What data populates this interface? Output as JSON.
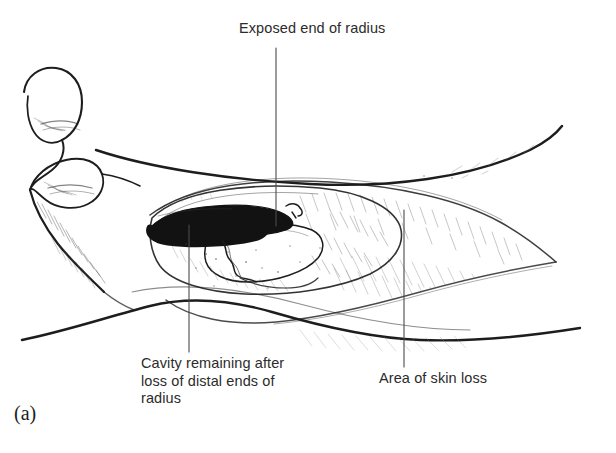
{
  "figure": {
    "marker": "(a)",
    "background_color": "#ffffff",
    "ink_color": "#1d1d1d",
    "text_color": "#2b2b2b"
  },
  "annotations": [
    {
      "id": "exposed-end-of-radius",
      "text": "Exposed end of radius",
      "leader": {
        "x": 276,
        "y_start": 48,
        "y_end": 226
      }
    },
    {
      "id": "cavity-remaining",
      "text": "Cavity remaining after\nloss of distal ends of\nradius",
      "lines": [
        "Cavity remaining after",
        "loss of distal ends of",
        "radius"
      ],
      "leader": {
        "x": 189,
        "y_start": 225,
        "y_end": 352
      }
    },
    {
      "id": "area-of-skin-loss",
      "text": "Area of skin loss",
      "leader": {
        "x": 404,
        "y_start": 210,
        "y_end": 367
      }
    }
  ]
}
